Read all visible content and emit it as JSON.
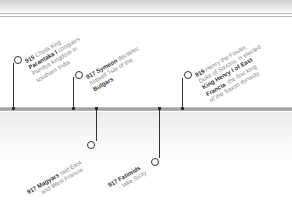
{
  "timeline": {
    "events_above": [
      {
        "year": "915",
        "lines": [
          {
            "pre": "",
            "bold": "",
            "post": " Chola king"
          },
          {
            "pre": "",
            "bold": "Parantaka I",
            "post": " conquers"
          },
          {
            "pre": "Pandya kingdom in",
            "bold": "",
            "post": ""
          },
          {
            "pre": "southern India",
            "bold": "",
            "post": ""
          }
        ]
      },
      {
        "year": "917",
        "lines": [
          {
            "pre": "",
            "bold": "Symeon",
            "post": " declares"
          },
          {
            "pre": "himself Tsar of the",
            "bold": "",
            "post": ""
          },
          {
            "pre": "",
            "bold": "Bulgars",
            "post": ""
          }
        ]
      },
      {
        "year": "919",
        "lines": [
          {
            "pre": "",
            "bold": "",
            "post": " Henry the Fowler,"
          },
          {
            "pre": "Duke of Saxony, is elected",
            "bold": "",
            "post": ""
          },
          {
            "pre": "",
            "bold": "King Henry I of East",
            "post": ""
          },
          {
            "pre": "",
            "bold": "Francia",
            "post": ", the first king"
          },
          {
            "pre": "of the Saxon dynasty",
            "bold": "",
            "post": ""
          }
        ]
      }
    ],
    "events_below": [
      {
        "year": "917",
        "lines": [
          {
            "pre": "",
            "bold": "Magyars",
            "post": " raid East"
          },
          {
            "pre": "and West Francia",
            "bold": "",
            "post": ""
          }
        ]
      },
      {
        "year": "917",
        "lines": [
          {
            "pre": "",
            "bold": "Fatimids",
            "post": ""
          },
          {
            "pre": "take Sicily",
            "bold": "",
            "post": ""
          }
        ]
      }
    ]
  },
  "colors": {
    "line": "#333333",
    "bar": "#a8a8a8",
    "text_muted": "#888888",
    "text_bold": "#333333"
  }
}
